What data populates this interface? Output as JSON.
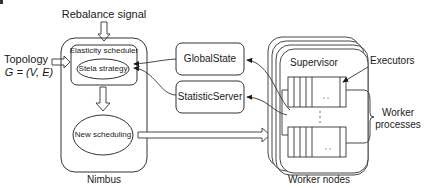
{
  "diagram": {
    "type": "architecture",
    "labels": {
      "rebalance_signal": "Rebalance signal",
      "topology_line1": "Topology",
      "topology_line2": "G = (V, E)",
      "elasticity_scheduler": "Elasticity scheduler",
      "stela_strategy": "Stela strategy",
      "new_scheduling": "New scheduling",
      "nimbus": "Nimbus",
      "global_state": "GlobalState",
      "statistic_server": "StatisticServer",
      "supervisor": "Supervisor",
      "executors": "Executors",
      "worker_processes_line1": "Worker",
      "worker_processes_line2": "processes",
      "worker_nodes": "Worker nodes",
      "ellipsis_h": ". .",
      "ellipsis_v": "⋮"
    },
    "nodes": [
      {
        "id": "nimbus",
        "label": "Nimbus",
        "shape": "rounded-rect"
      },
      {
        "id": "elasticity_scheduler",
        "label": "Elasticity scheduler",
        "parent": "nimbus"
      },
      {
        "id": "stela_strategy",
        "label": "Stela strategy",
        "shape": "ellipse",
        "parent": "elasticity_scheduler"
      },
      {
        "id": "new_scheduling",
        "label": "New scheduling",
        "shape": "ellipse",
        "parent": "nimbus"
      },
      {
        "id": "global_state",
        "label": "GlobalState",
        "shape": "rounded-rect"
      },
      {
        "id": "statistic_server",
        "label": "StatisticServer",
        "shape": "rounded-rect"
      },
      {
        "id": "worker_nodes",
        "label": "Worker nodes",
        "shape": "stacked-rounded-rect"
      },
      {
        "id": "supervisor",
        "label": "Supervisor",
        "parent": "worker_nodes"
      }
    ],
    "edges": [
      {
        "from": "rebalance_signal",
        "to": "elasticity_scheduler",
        "style": "block-arrow"
      },
      {
        "from": "topology",
        "to": "elasticity_scheduler",
        "style": "block-arrow"
      },
      {
        "from": "elasticity_scheduler",
        "to": "new_scheduling",
        "style": "block-arrow"
      },
      {
        "from": "new_scheduling",
        "to": "worker_nodes",
        "style": "block-arrow"
      },
      {
        "from": "global_state",
        "to": "stela_strategy",
        "style": "curved-arrow"
      },
      {
        "from": "statistic_server",
        "to": "stela_strategy",
        "style": "curved-arrow"
      },
      {
        "from": "worker_nodes",
        "to": "global_state",
        "style": "curved-arrow"
      },
      {
        "from": "worker_nodes",
        "to": "statistic_server",
        "style": "curved-arrow"
      }
    ]
  }
}
